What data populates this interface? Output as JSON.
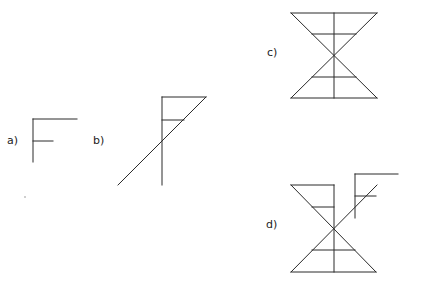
{
  "figure": {
    "panels": [
      {
        "id": "a",
        "label": "a)",
        "description": "F-shaped figure: vertical stem with long top bar and short middle bar"
      },
      {
        "id": "b",
        "label": "b)",
        "description": "F-shaped figure with a diagonal line from the top bar's right end crossing the stem"
      },
      {
        "id": "c",
        "label": "c)",
        "description": "Hourglass: two triangles meeting at a point, with vertical axis and horizontal rungs"
      },
      {
        "id": "d",
        "label": "d)",
        "description": "Hourglass with extended diagonal and a small F-shaped figure attached at upper right"
      }
    ],
    "stroke_color": "#2a2a2a",
    "background": "#ffffff"
  }
}
